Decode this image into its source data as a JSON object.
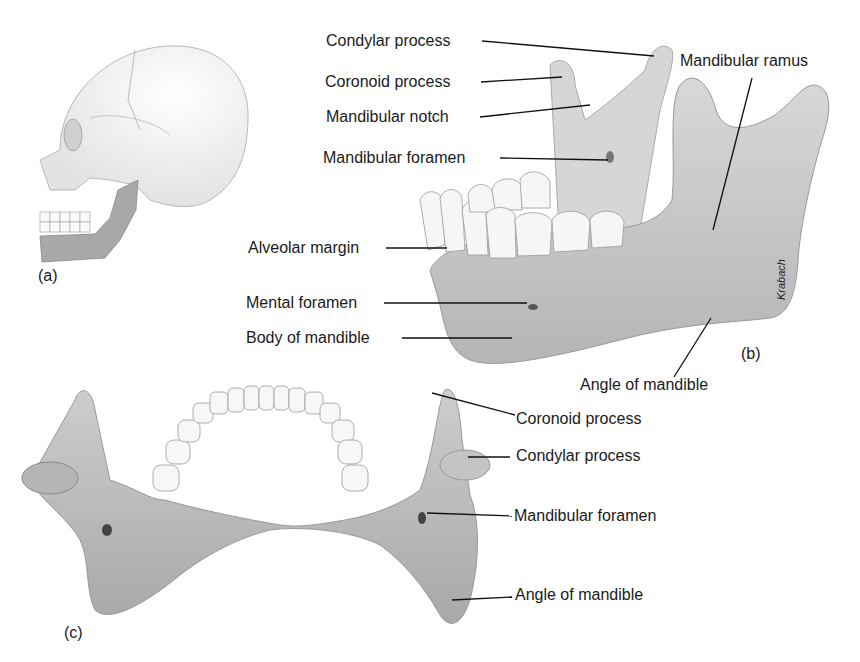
{
  "figure": {
    "panels": [
      {
        "id": "a",
        "label": "(a)",
        "description": "Lateral view of skull with mandible shaded"
      },
      {
        "id": "b",
        "label": "(b)",
        "description": "Lateral view of mandible"
      },
      {
        "id": "c",
        "label": "(c)",
        "description": "Superior view of mandible"
      }
    ],
    "credit": "Krabach",
    "labels_b": {
      "condylar_process": "Condylar process",
      "coronoid_process": "Coronoid process",
      "mandibular_notch": "Mandibular notch",
      "mandibular_foramen": "Mandibular foramen",
      "mandibular_ramus": "Mandibular ramus",
      "alveolar_margin": "Alveolar margin",
      "mental_foramen": "Mental foramen",
      "body_of_mandible": "Body of mandible",
      "angle_of_mandible": "Angle of mandible"
    },
    "labels_c": {
      "coronoid_process": "Coronoid process",
      "condylar_process": "Condylar process",
      "mandibular_foramen": "Mandibular foramen",
      "angle_of_mandible": "Angle of mandible"
    },
    "colors": {
      "bone": "#cfcfcf",
      "bone_shade": "#a9a9a9",
      "tooth": "#f4f4f4",
      "skull": "#ececec",
      "line": "#111111"
    }
  }
}
